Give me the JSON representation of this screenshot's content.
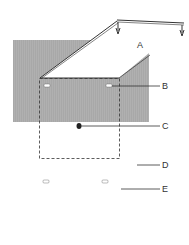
{
  "labels": {
    "A": "A",
    "B": "B",
    "C": "C",
    "D": "D",
    "E": "E"
  },
  "colors": {
    "board": "#a9a9a9",
    "lid": "#ffffff",
    "line": "#333333",
    "background": "#ffffff"
  }
}
